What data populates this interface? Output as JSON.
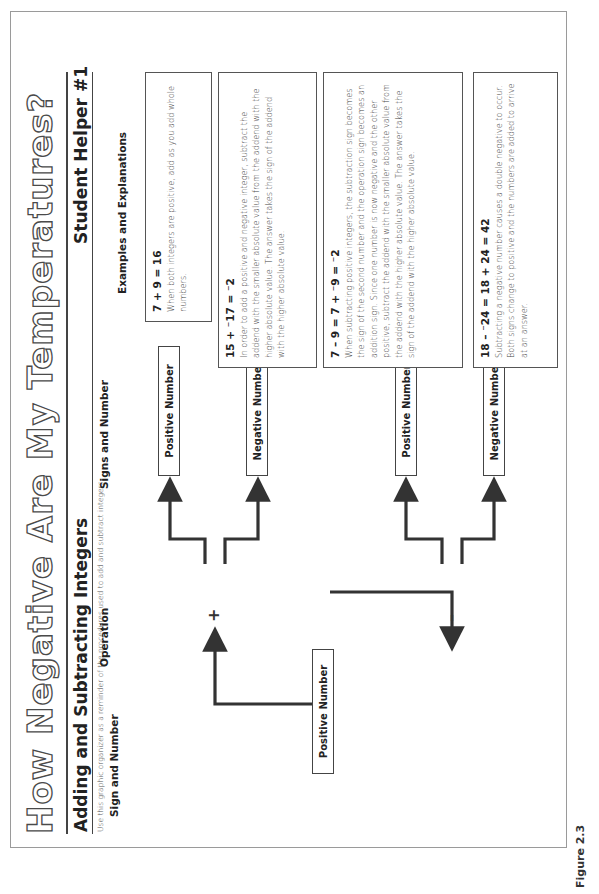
{
  "page": {
    "title": "How Negative Are My Temperatures?",
    "section_title": "Adding and Subtracting Integers",
    "helper_title": "Student Helper #1",
    "instructions": "Use this graphic organizer as a reminder of the procedures used to add and subtract integers.",
    "figure_label": "Figure 2.3"
  },
  "columns": {
    "sign_and_number": "Sign and Number",
    "operation": "Operation",
    "signs_and_number": "Signs and Number",
    "examples": "Examples and Explanations"
  },
  "diagram": {
    "start_box": "Positive Number",
    "operations": [
      {
        "symbol": "+",
        "results": [
          "Positive Number",
          "Negative Number"
        ]
      },
      {
        "symbol": "–",
        "results": [
          "Positive Number",
          "Negative Number"
        ]
      }
    ]
  },
  "examples": [
    {
      "equation": "7 + 9 = 16",
      "explanation": "When both integers are positive, add as you add whole numbers."
    },
    {
      "equation": "15 + ⁻17 = ⁻2",
      "explanation": "In order to add a positive and negative integer, subtract the addend with the smaller absolute value from the addend with the higher absolute value. The answer takes the sign of the addend with the higher absolute value."
    },
    {
      "equation": "7 – 9 = 7 + ⁻9 = ⁻2",
      "explanation": "When subtracting positive integers, the subtraction sign becomes the sign of the second number and the operation sign becomes an addition sign. Since one number is now negative and the other positive, subtract the addend with the smaller absolute value from the addend with the higher absolute value. The answer takes the sign of the addend with the higher absolute value."
    },
    {
      "equation": "18 – ⁻24 = 18 + 24 = 42",
      "explanation": "Subtracting a negative number causes a double negative to occur. Both signs change to positive and the numbers are added to arrive at an answer."
    }
  ]
}
